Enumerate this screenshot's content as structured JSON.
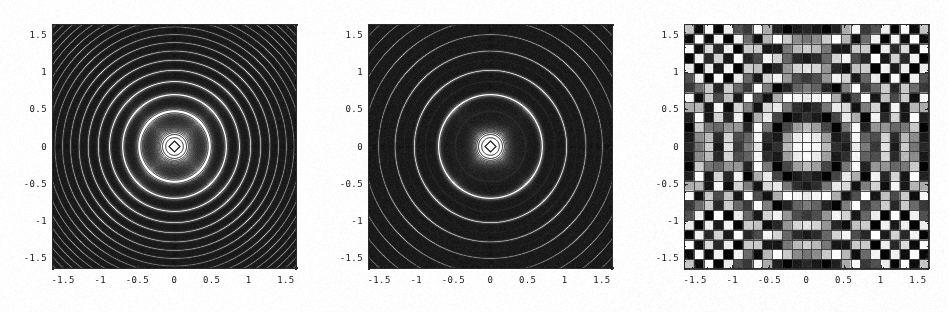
{
  "figure": {
    "title": "",
    "background": "#ffffff",
    "width": 949,
    "height": 312,
    "panel_count": 3
  },
  "axes": {
    "x_ticks": [
      "-1.5",
      "-1",
      "-0.5",
      "0",
      "0.5",
      "1",
      "1.5"
    ],
    "y_ticks": [
      "1.5",
      "1",
      "0.5",
      "0",
      "-0.5",
      "-1",
      "-1.5"
    ],
    "x_tick_values": [
      -1.5,
      -1,
      -0.5,
      0,
      0.5,
      1,
      1.5
    ],
    "y_tick_values": [
      1.5,
      1,
      0.5,
      0,
      -0.5,
      -1,
      -1.5
    ],
    "xlim": [
      -1.65,
      1.65
    ],
    "ylim": [
      -1.65,
      1.65
    ],
    "xlabel": "",
    "ylabel": "",
    "frame_color": "#2b2b2b",
    "tick_color": "#2b2b2b",
    "label_color": "#1a1a1a"
  },
  "chart_data": [
    {
      "type": "line",
      "plot_kind": "contour",
      "name": "contour-plot",
      "title": "",
      "xlabel": "",
      "ylabel": "",
      "xlim": [
        -1.65,
        1.65
      ],
      "ylim": [
        -1.65,
        1.65
      ],
      "x_ticks": [
        "-1.5",
        "-1",
        "-0.5",
        "0",
        "0.5",
        "1",
        "1.5"
      ],
      "y_ticks": [
        "1.5",
        "1",
        "0.5",
        "0",
        "-0.5",
        "-1",
        "-1.5"
      ],
      "grid": false,
      "legend": "none",
      "function": "cos(12*(x^2+y^2)^0.9)",
      "radial": true,
      "contour_count": 30,
      "contour_color": "#1a1a1a",
      "fill": "none",
      "center_marker": "diamond",
      "description": "Radially symmetric oscillating contour plot; rings densify toward the corners"
    },
    {
      "type": "line",
      "plot_kind": "filled-contour",
      "name": "shaded-contour-plot",
      "title": "",
      "xlabel": "",
      "ylabel": "",
      "xlim": [
        -1.65,
        1.65
      ],
      "ylim": [
        -1.65,
        1.65
      ],
      "x_ticks": [
        "-1.5",
        "-1",
        "-0.5",
        "0",
        "0.5",
        "1",
        "1.5"
      ],
      "y_ticks": [
        "1.5",
        "1",
        "0.5",
        "0",
        "-0.5",
        "-1",
        "-1.5"
      ],
      "grid": false,
      "legend": "none",
      "function": "cos(12*(x^2+y^2)^0.9)",
      "radial": true,
      "contour_count": 30,
      "contour_color": "#1a1a1a",
      "fill": "grayscale",
      "fill_range": [
        "#2a2a2a",
        "#ffffff"
      ],
      "center_marker": "diamond",
      "description": "Same contours with grayscale band shading between levels"
    },
    {
      "type": "heatmap",
      "plot_kind": "density",
      "name": "density-plot",
      "title": "",
      "xlabel": "",
      "ylabel": "",
      "xlim": [
        -1.65,
        1.65
      ],
      "ylim": [
        -1.65,
        1.65
      ],
      "x_ticks": [
        "-1.5",
        "-1",
        "-0.5",
        "0",
        "0.5",
        "1",
        "1.5"
      ],
      "y_ticks": [
        "1.5",
        "1",
        "0.5",
        "0",
        "-0.5",
        "-1",
        "-1.5"
      ],
      "grid": true,
      "grid_color": "#3a3a3a",
      "legend": "none",
      "function": "cos(12*(x^2+y^2)^0.9)",
      "radial": true,
      "cells_x": 25,
      "cells_y": 25,
      "colormap": "grayscale",
      "colormap_range": [
        "#000000",
        "#ffffff"
      ],
      "description": "25x25 grayscale density mesh of the same radial function, dark in corners"
    }
  ],
  "render": {
    "plot_left": 52,
    "plot_top": 24,
    "plot_size": 245,
    "panel_pitch": 316,
    "noise_amount": 0.05
  }
}
